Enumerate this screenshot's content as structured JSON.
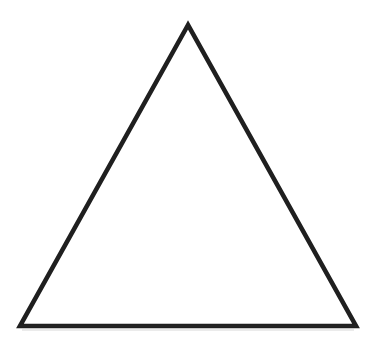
{
  "figure": {
    "name": "triangle",
    "background_color": "#ffffff",
    "stroke_color": "#1f1f1f",
    "stroke_width": 4.6,
    "canvas": {
      "width": 376,
      "height": 350
    },
    "vertices": {
      "apex": {
        "x": 188,
        "y": 25,
        "label": "apex"
      },
      "bottom_left": {
        "x": 20,
        "y": 326,
        "label": "bottom-left"
      },
      "bottom_right": {
        "x": 356,
        "y": 326,
        "label": "bottom-right"
      }
    },
    "points_path": "188,25 20,326 356,326",
    "baseline_path": "20,326 356,326",
    "baseline_shadow_path": "22,330 354,330",
    "edges": [
      {
        "name": "left-edge",
        "from": "apex",
        "to": "bottom-left"
      },
      {
        "name": "right-edge",
        "from": "apex",
        "to": "bottom-right"
      },
      {
        "name": "base-edge",
        "from": "bottom-left",
        "to": "bottom-right"
      }
    ]
  }
}
